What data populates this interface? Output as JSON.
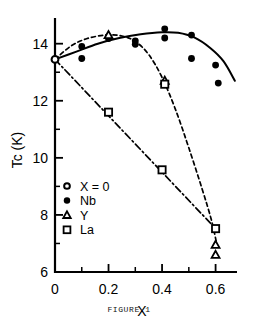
{
  "figure": {
    "caption": "FIGURE 1"
  },
  "chart_data": {
    "type": "scatter",
    "title": "",
    "xlabel": "X",
    "ylabel": "Tc  (K)",
    "xlim": [
      0,
      0.68
    ],
    "ylim": [
      6,
      14.9
    ],
    "grid": false,
    "legend_position": "lower-left-inside",
    "x_ticks_major": [
      0,
      0.2,
      0.4,
      0.6
    ],
    "x_tick_labels": [
      "0",
      "0.2",
      "0.4",
      "0.6"
    ],
    "x_ticks_minor": [
      0.1,
      0.3,
      0.5
    ],
    "y_ticks_major": [
      6,
      8,
      10,
      12,
      14
    ],
    "y_tick_labels": [
      "6",
      "8",
      "10",
      "12",
      "14"
    ],
    "y_ticks_minor": [
      7,
      9,
      11,
      13
    ],
    "legend": [
      {
        "key": "x0",
        "label": "X = 0",
        "marker": "open-circle"
      },
      {
        "key": "nb",
        "label": "Nb",
        "marker": "filled-circle"
      },
      {
        "key": "y",
        "label": "Y",
        "marker": "open-triangle"
      },
      {
        "key": "la",
        "label": "La",
        "marker": "open-square"
      }
    ],
    "series": [
      {
        "name": "X = 0",
        "marker": "open-circle",
        "points": [
          [
            0.0,
            13.45
          ]
        ]
      },
      {
        "name": "Nb",
        "marker": "filled-circle",
        "points": [
          [
            0.1,
            13.9
          ],
          [
            0.1,
            13.48
          ],
          [
            0.2,
            14.25
          ],
          [
            0.2,
            14.18
          ],
          [
            0.3,
            14.1
          ],
          [
            0.3,
            13.98
          ],
          [
            0.41,
            14.52
          ],
          [
            0.41,
            14.2
          ],
          [
            0.51,
            14.3
          ],
          [
            0.51,
            13.48
          ],
          [
            0.6,
            13.25
          ],
          [
            0.61,
            12.62
          ]
        ]
      },
      {
        "name": "Y",
        "marker": "open-triangle",
        "points": [
          [
            0.2,
            14.3
          ],
          [
            0.41,
            12.7
          ],
          [
            0.6,
            6.95
          ],
          [
            0.6,
            6.6
          ]
        ]
      },
      {
        "name": "La",
        "marker": "open-square",
        "points": [
          [
            0.2,
            11.6
          ],
          [
            0.4,
            9.58
          ],
          [
            0.41,
            12.58
          ],
          [
            0.6,
            7.52
          ]
        ]
      }
    ],
    "curves": [
      {
        "name": "Nb fit",
        "style": "solid",
        "path": [
          [
            0.0,
            13.45
          ],
          [
            0.08,
            13.72
          ],
          [
            0.16,
            14.0
          ],
          [
            0.24,
            14.2
          ],
          [
            0.32,
            14.33
          ],
          [
            0.4,
            14.4
          ],
          [
            0.46,
            14.38
          ],
          [
            0.52,
            14.22
          ],
          [
            0.58,
            13.85
          ],
          [
            0.63,
            13.38
          ],
          [
            0.672,
            12.7
          ]
        ]
      },
      {
        "name": "Y fit",
        "style": "dotted",
        "path": [
          [
            0.0,
            13.45
          ],
          [
            0.06,
            13.92
          ],
          [
            0.12,
            14.18
          ],
          [
            0.19,
            14.3
          ],
          [
            0.25,
            14.27
          ],
          [
            0.3,
            14.08
          ],
          [
            0.35,
            13.62
          ],
          [
            0.4,
            12.82
          ],
          [
            0.45,
            11.7
          ],
          [
            0.5,
            10.35
          ],
          [
            0.55,
            8.9
          ],
          [
            0.585,
            7.8
          ],
          [
            0.605,
            6.95
          ]
        ]
      },
      {
        "name": "La fit",
        "style": "dash-dot",
        "path": [
          [
            0.0,
            13.45
          ],
          [
            0.6,
            7.52
          ]
        ]
      }
    ]
  }
}
